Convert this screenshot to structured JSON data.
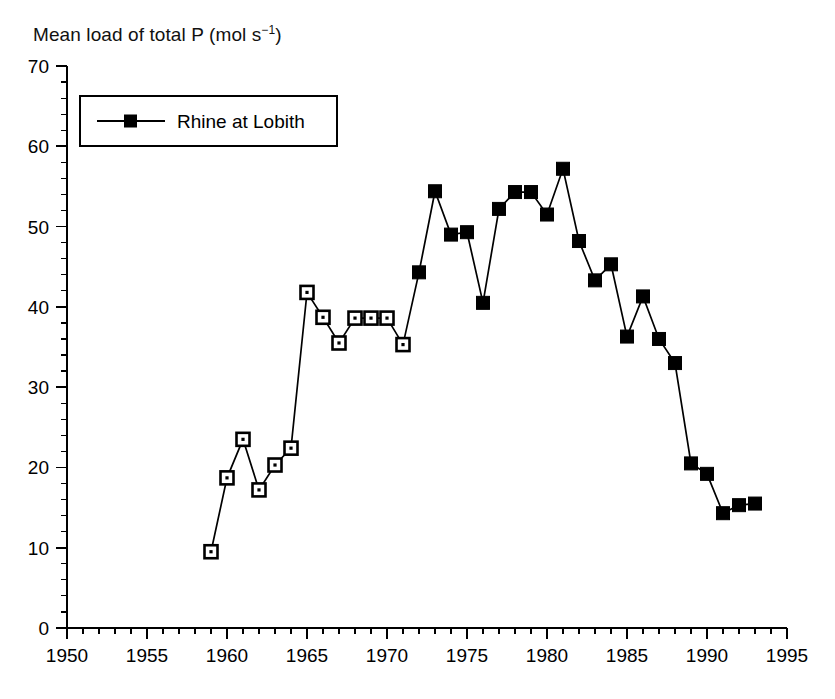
{
  "chart_data": {
    "type": "line",
    "title_main": "Mean load of total P (mol s",
    "title_sup": "−1",
    "title_tail": ")",
    "xlabel": "",
    "ylabel": "Mean load of total P (mol s−1)",
    "xlim": [
      1950,
      1995
    ],
    "ylim": [
      0,
      70
    ],
    "x_major_step": 5,
    "x_minor_step": 1,
    "y_major_step": 10,
    "y_minor_step": 2,
    "grid": false,
    "legend_position": "top-left",
    "legend": [
      "Rhine at Lobith"
    ],
    "x_tick_labels": [
      "1950",
      "1955",
      "1960",
      "1965",
      "1970",
      "1975",
      "1980",
      "1985",
      "1990",
      "1995"
    ],
    "y_tick_labels": [
      "0",
      "10",
      "20",
      "30",
      "40",
      "50",
      "60",
      "70"
    ],
    "series": [
      {
        "name": "Rhine at Lobith",
        "marker": "square",
        "x": [
          1959,
          1960,
          1961,
          1962,
          1963,
          1964,
          1965,
          1966,
          1967,
          1968,
          1969,
          1970,
          1971,
          1972,
          1973,
          1974,
          1975,
          1976,
          1977,
          1978,
          1979,
          1980,
          1981,
          1982,
          1983,
          1984,
          1985,
          1986,
          1987,
          1988,
          1989,
          1990,
          1991,
          1992,
          1993
        ],
        "values": [
          9.5,
          18.7,
          23.5,
          17.2,
          20.3,
          22.4,
          41.8,
          38.7,
          35.5,
          38.6,
          38.6,
          38.6,
          35.3,
          44.3,
          54.4,
          49.0,
          49.3,
          40.5,
          52.2,
          54.3,
          54.3,
          51.5,
          57.2,
          48.2,
          43.3,
          45.3,
          36.3,
          41.3,
          36.0,
          33.0,
          20.5,
          19.2,
          14.3,
          15.3,
          15.5
        ],
        "marker_styles": [
          "open",
          "open",
          "open",
          "open",
          "open",
          "open",
          "open",
          "open",
          "open",
          "open",
          "open",
          "open",
          "open",
          "filled",
          "filled",
          "filled",
          "filled",
          "filled",
          "filled",
          "filled",
          "filled",
          "filled",
          "filled",
          "filled",
          "filled",
          "filled",
          "filled",
          "filled",
          "filled",
          "filled",
          "filled",
          "filled",
          "filled",
          "filled",
          "filled"
        ]
      }
    ],
    "colors": {
      "line": "#000000",
      "marker": "#000000",
      "background": "#ffffff",
      "axis": "#000000"
    }
  }
}
